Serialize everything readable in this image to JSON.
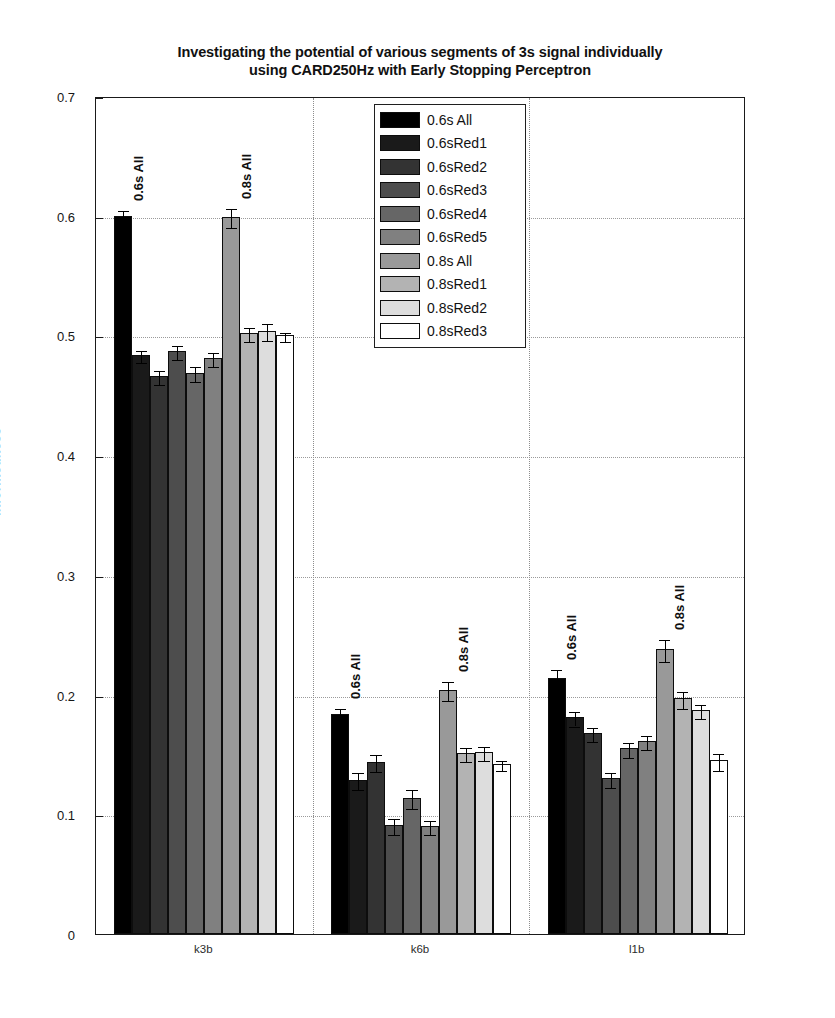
{
  "chart_data": {
    "type": "bar",
    "title": "Investigating the potential of various segments of 3s signal individually using CARD250Hz with Early Stopping Perceptron",
    "title_lines": [
      "Investigating the potential of various segments of 3s signal individually",
      "using CARD250Hz with Early Stopping Perceptron"
    ],
    "xlabel": "",
    "ylabel": "Informedness",
    "ylim": [
      0,
      0.7
    ],
    "yticks": [
      "0",
      "0.1",
      "0.2",
      "0.3",
      "0.4",
      "0.5",
      "0.6",
      "0.7"
    ],
    "ytick_values": [
      0,
      0.1,
      0.2,
      0.3,
      0.4,
      0.5,
      0.6,
      0.7
    ],
    "grid": true,
    "grid_style": "dotted",
    "legend_position": "top-center",
    "categories": [
      "k3b",
      "k6b",
      "l1b"
    ],
    "series": [
      {
        "name": "0.6s All",
        "color": "#000000",
        "values": [
          0.6,
          0.184,
          0.214
        ],
        "errors": [
          0.006,
          0.006,
          0.008
        ]
      },
      {
        "name": "0.6sRed1",
        "color": "#1a1a1a",
        "values": [
          0.484,
          0.129,
          0.181
        ],
        "errors": [
          0.005,
          0.007,
          0.006
        ]
      },
      {
        "name": "0.6sRed2",
        "color": "#333333",
        "values": [
          0.466,
          0.144,
          0.168
        ],
        "errors": [
          0.006,
          0.007,
          0.006
        ]
      },
      {
        "name": "0.6sRed3",
        "color": "#4d4d4d",
        "values": [
          0.487,
          0.091,
          0.13
        ],
        "errors": [
          0.006,
          0.007,
          0.006
        ]
      },
      {
        "name": "0.6sRed4",
        "color": "#666666",
        "values": [
          0.469,
          0.114,
          0.155
        ],
        "errors": [
          0.006,
          0.008,
          0.006
        ]
      },
      {
        "name": "0.6sRed5",
        "color": "#808080",
        "values": [
          0.481,
          0.09,
          0.161
        ],
        "errors": [
          0.006,
          0.006,
          0.006
        ]
      },
      {
        "name": "0.8s All",
        "color": "#999999",
        "values": [
          0.599,
          0.204,
          0.238
        ],
        "errors": [
          0.008,
          0.008,
          0.009
        ]
      },
      {
        "name": "0.8sRed1",
        "color": "#b3b3b3",
        "values": [
          0.502,
          0.151,
          0.197
        ],
        "errors": [
          0.006,
          0.006,
          0.007
        ]
      },
      {
        "name": "0.8sRed2",
        "color": "#dddddd",
        "values": [
          0.504,
          0.152,
          0.187
        ],
        "errors": [
          0.007,
          0.006,
          0.006
        ]
      },
      {
        "name": "0.8sRed3",
        "color": "#ffffff",
        "values": [
          0.5,
          0.142,
          0.145
        ],
        "errors": [
          0.004,
          0.004,
          0.007
        ]
      }
    ],
    "bar_annotations": [
      {
        "group": "k3b",
        "series": "0.6s All",
        "text": "0.6s All"
      },
      {
        "group": "k3b",
        "series": "0.8s All",
        "text": "0.8s All"
      },
      {
        "group": "k6b",
        "series": "0.6s All",
        "text": "0.6s All"
      },
      {
        "group": "k6b",
        "series": "0.8s All",
        "text": "0.8s All"
      },
      {
        "group": "l1b",
        "series": "0.6s All",
        "text": "0.6s All"
      },
      {
        "group": "l1b",
        "series": "0.8s All",
        "text": "0.8s All"
      }
    ]
  },
  "legend": {
    "items": [
      {
        "label": "0.6s All",
        "color": "#000000"
      },
      {
        "label": "0.6sRed1",
        "color": "#1a1a1a"
      },
      {
        "label": "0.6sRed2",
        "color": "#333333"
      },
      {
        "label": "0.6sRed3",
        "color": "#4d4d4d"
      },
      {
        "label": "0.6sRed4",
        "color": "#666666"
      },
      {
        "label": "0.6sRed5",
        "color": "#808080"
      },
      {
        "label": "0.8s All",
        "color": "#999999"
      },
      {
        "label": "0.8sRed1",
        "color": "#b3b3b3"
      },
      {
        "label": "0.8sRed2",
        "color": "#dddddd"
      },
      {
        "label": "0.8sRed3",
        "color": "#ffffff"
      }
    ]
  }
}
